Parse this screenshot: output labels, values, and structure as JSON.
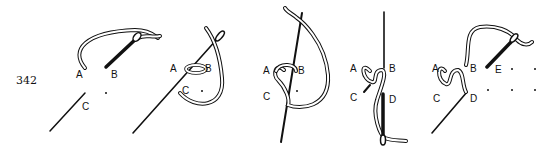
{
  "figure": {
    "number": "342",
    "steps": [
      {
        "id": 1,
        "labels": [
          "A",
          "B",
          "C"
        ]
      },
      {
        "id": 2,
        "labels": [
          "A",
          "B",
          "C"
        ]
      },
      {
        "id": 3,
        "labels": [
          "A",
          "B",
          "C"
        ]
      },
      {
        "id": 4,
        "labels": [
          "A",
          "B",
          "C",
          "D"
        ]
      },
      {
        "id": 5,
        "labels": [
          "A",
          "B",
          "C",
          "D",
          "E"
        ]
      }
    ]
  },
  "colors": {
    "ink": "#111111",
    "paper": "#ffffff"
  }
}
